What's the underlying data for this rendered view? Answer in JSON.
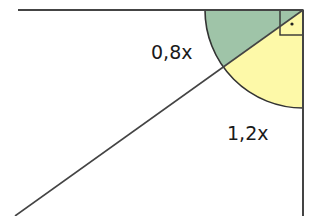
{
  "diagram": {
    "type": "geometry",
    "labels": {
      "upper_angle": "0,8x",
      "lower_angle": "1,2x"
    },
    "right_angle_marker": "·",
    "colors": {
      "upper_sector": "#9fc4a8",
      "lower_sector": "#fdf9a8",
      "stroke": "#333333"
    }
  }
}
